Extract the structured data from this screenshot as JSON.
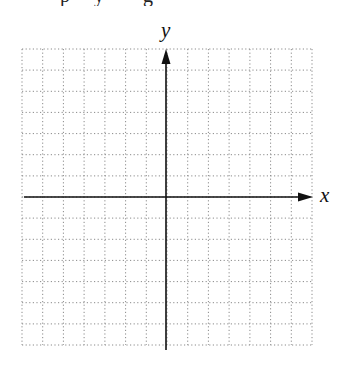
{
  "header": {
    "clipped_fragments": [
      {
        "text": "p",
        "x": 60
      },
      {
        "text": "y",
        "x": 94
      },
      {
        "text": "g",
        "x": 143
      }
    ]
  },
  "graph": {
    "grid": {
      "left": 22,
      "top": 49,
      "right": 312,
      "bottom": 345,
      "columns": 14,
      "rows": 14,
      "line_color": "#8a8a8a",
      "dash": "1.2 2.4"
    },
    "axes": {
      "origin_x": 166,
      "origin_y": 197,
      "color": "#111111",
      "x_start": 24,
      "x_end": 313,
      "y_start": 350,
      "y_end": 49
    },
    "x_axis_label": "x",
    "y_axis_label": "y"
  }
}
